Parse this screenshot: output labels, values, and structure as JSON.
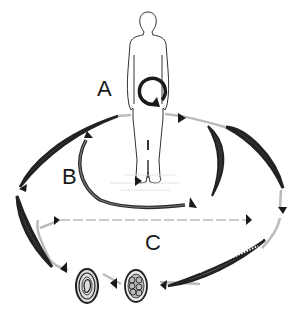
{
  "diagram": {
    "type": "life-cycle",
    "colors": {
      "ink": "#1a1a1a",
      "stroke": "#333333",
      "faint": "#bbbbbb",
      "background": "#ffffff"
    },
    "labels": {
      "a": "A",
      "b": "B",
      "c": "C"
    },
    "nodes": [
      {
        "id": "host",
        "kind": "human-figure"
      },
      {
        "id": "autoinfection",
        "kind": "circular-arrow",
        "cycle": "A"
      },
      {
        "id": "larva-inner-left",
        "kind": "worm",
        "cycle": "B"
      },
      {
        "id": "larva-inner-right",
        "kind": "worm",
        "cycle": "B"
      },
      {
        "id": "worm-outer-left-top",
        "kind": "worm",
        "cycle": "outer"
      },
      {
        "id": "worm-outer-right",
        "kind": "worm",
        "cycle": "outer"
      },
      {
        "id": "worm-outer-left",
        "kind": "worm",
        "cycle": "C"
      },
      {
        "id": "larva-bottom-right",
        "kind": "segmented-larva",
        "cycle": "C"
      },
      {
        "id": "egg-morula",
        "kind": "egg"
      },
      {
        "id": "egg-embryonated",
        "kind": "egg"
      }
    ],
    "cycles": [
      "A",
      "B",
      "C"
    ]
  }
}
